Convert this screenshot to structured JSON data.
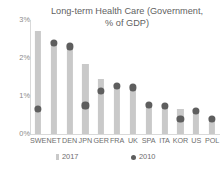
{
  "chart_data": {
    "type": "bar",
    "title": "Long-term Health Care (Government,\n% of GDP)",
    "xlabel": "",
    "ylabel": "",
    "ylim": [
      0,
      3
    ],
    "ytick_labels": [
      "0%",
      "1%",
      "2%",
      "3%"
    ],
    "ytick_values": [
      0,
      1,
      2,
      3
    ],
    "grid": false,
    "legend_position": "bottom",
    "categories": [
      "SWE",
      "NET",
      "DEN",
      "JPN",
      "GER",
      "FRA",
      "UK",
      "SPA",
      "ITA",
      "KOR",
      "US",
      "POL"
    ],
    "series": [
      {
        "name": "2017",
        "type": "bar",
        "color": "#c9c9c9",
        "values": [
          2.7,
          2.45,
          2.35,
          1.85,
          1.45,
          1.3,
          1.25,
          0.78,
          0.75,
          0.65,
          0.62,
          0.42
        ]
      },
      {
        "name": "2010",
        "type": "scatter",
        "color": "#5e5e5e",
        "values": [
          0.65,
          2.4,
          2.3,
          0.75,
          1.12,
          1.26,
          1.22,
          0.76,
          0.73,
          0.4,
          0.6,
          0.4
        ]
      }
    ]
  },
  "legend": {
    "items": [
      {
        "label": "2017",
        "marker": "bar-swatch-icon"
      },
      {
        "label": "2010",
        "marker": "dot-swatch-icon"
      }
    ]
  }
}
